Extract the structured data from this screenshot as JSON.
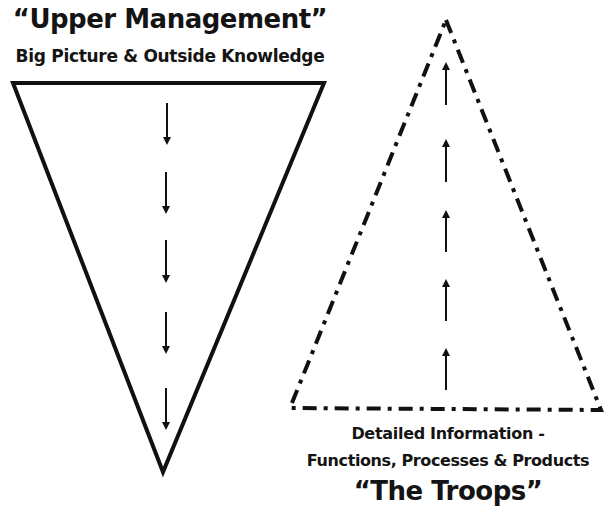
{
  "top_group": {
    "title": "“Upper Management”",
    "subtitle": "Big Picture & Outside Knowledge",
    "shape": "inverted-triangle-solid",
    "arrow_direction": "down",
    "arrow_count": 5
  },
  "bottom_group": {
    "caption_line1": "Detailed Information -",
    "caption_line2": "Functions, Processes & Products",
    "title": "“The Troops”",
    "shape": "triangle-dash-dot",
    "arrow_direction": "up",
    "arrow_count": 5
  },
  "colors": {
    "stroke": "#111111",
    "background": "#ffffff"
  }
}
